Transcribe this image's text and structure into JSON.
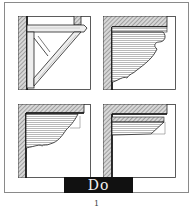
{
  "figure": {
    "label": "Do",
    "page_number": "1",
    "panels": [
      {
        "id": "top-left",
        "subject": "timber bracket with diagonal brace"
      },
      {
        "id": "top-right",
        "subject": "ornamental scrolled bracket with horizontal grain"
      },
      {
        "id": "bottom-left",
        "subject": "curved bracket under beam"
      },
      {
        "id": "bottom-right",
        "subject": "shallow wedge bracket under beam"
      }
    ],
    "colors": {
      "ink": "#222222",
      "hatch": "#777777",
      "label_bg": "#111111",
      "label_text": "#f2f2f2",
      "frame": "#8a8a8a"
    }
  }
}
